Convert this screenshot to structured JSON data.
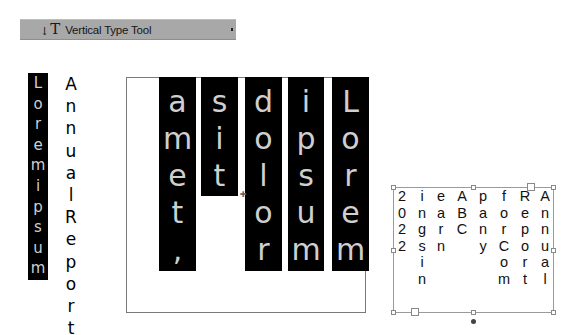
{
  "toolbar": {
    "icon": "vertical-type-icon",
    "icon_glyph": "T",
    "icon_arrow": "↓",
    "label": "Vertical Type Tool"
  },
  "left_sample": {
    "highlighted_text": [
      "L",
      "o",
      "r",
      "e",
      "m",
      "i",
      "p",
      "s",
      "u",
      "m"
    ],
    "plain_text": [
      "A",
      "n",
      "n",
      "u",
      "a",
      "l",
      "R",
      "e",
      "p",
      "o",
      "r",
      "t"
    ]
  },
  "big_frame": {
    "columns": [
      {
        "word": "amet,",
        "letters": [
          "a",
          "m",
          "e",
          "t",
          ","
        ]
      },
      {
        "word": "sit",
        "letters": [
          "s",
          "i",
          "t"
        ]
      },
      {
        "word": "dolor",
        "letters": [
          "d",
          "o",
          "l",
          "o",
          "r"
        ]
      },
      {
        "word": "ipsum",
        "letters": [
          "i",
          "p",
          "s",
          "u",
          "m"
        ]
      },
      {
        "word": "Lorem",
        "letters": [
          "L",
          "o",
          "r",
          "e",
          "m"
        ]
      }
    ],
    "highlight_color": "#000000",
    "text_color": "#cfcfcf"
  },
  "small_frame": {
    "columns": [
      {
        "letters": [
          "2",
          "0",
          "2",
          "2"
        ]
      },
      {
        "letters": [
          "i",
          "n",
          "g",
          "s",
          "i",
          "n"
        ]
      },
      {
        "letters": [
          "e",
          "a",
          "r",
          "n"
        ]
      },
      {
        "letters": [
          "A",
          "B",
          "C"
        ]
      },
      {
        "letters": [
          "p",
          "a",
          "n",
          "y"
        ]
      },
      {
        "letters": [
          "f",
          "o",
          "r",
          "C",
          "o",
          "m"
        ]
      },
      {
        "letters": [
          "R",
          "e",
          "p",
          "o",
          "r",
          "t"
        ]
      },
      {
        "letters": [
          "A",
          "n",
          "n",
          "u",
          "a",
          "l"
        ]
      }
    ]
  }
}
